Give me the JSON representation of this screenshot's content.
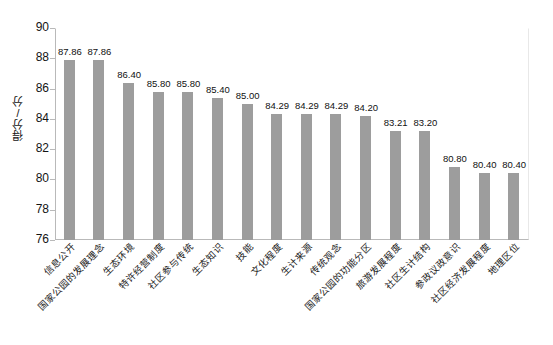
{
  "chart_data": {
    "type": "bar",
    "title": "",
    "subtitle": "",
    "xlabel": "",
    "ylabel": "得分/分",
    "ylim": [
      76,
      90
    ],
    "ytick_step": 2,
    "yticks": [
      90,
      88,
      86,
      84,
      82,
      80,
      78,
      76
    ],
    "grid": false,
    "legend": false,
    "legend_position": "none",
    "bar_color": "#9d9d9d",
    "axis_color": "#b9b9b9",
    "categories": [
      "信息公开",
      "国家公园的发展理念",
      "生态环境",
      "特许经营制度",
      "社区参与传统",
      "生态知识",
      "技能",
      "文化程度",
      "生计来源",
      "传统观念",
      "国家公园的功能分区",
      "旅游发展程度",
      "社区生计结构",
      "参政议政意识",
      "社区经济发展程度",
      "地理区位"
    ],
    "values": [
      87.86,
      87.86,
      86.4,
      85.8,
      85.8,
      85.4,
      85.0,
      84.29,
      84.29,
      84.29,
      84.2,
      83.21,
      83.2,
      80.8,
      80.4,
      80.4
    ],
    "value_labels": [
      "87.86",
      "87.86",
      "86.40",
      "85.80",
      "85.80",
      "85.40",
      "85.00",
      "84.29",
      "84.29",
      "84.29",
      "84.20",
      "83.21",
      "83.20",
      "80.80",
      "80.40",
      "80.40"
    ]
  }
}
